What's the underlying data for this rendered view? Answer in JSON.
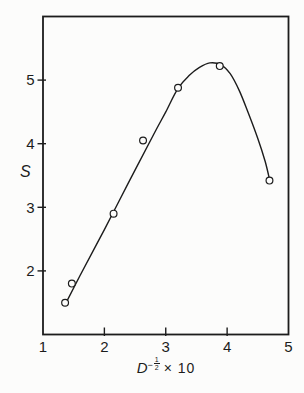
{
  "figure": {
    "background": "#fcfcfb",
    "ink": "#1c1c1c"
  },
  "y_axis_title": "S",
  "x_axis_title": {
    "variable": "D",
    "exponent_sign": "−",
    "exponent_numerator": "1",
    "exponent_denominator": "2",
    "multiplier": "× 10"
  },
  "chart_data": {
    "type": "scatter",
    "title": "",
    "xlabel": "D^(-1/2) × 10",
    "ylabel": "S",
    "xlim": [
      1,
      5
    ],
    "ylim": [
      1,
      6
    ],
    "grid": false,
    "legend": false,
    "marker": "open-circle",
    "x_tick_labels": [
      1,
      2,
      3,
      4,
      5
    ],
    "x_tick_marks": [
      2,
      3,
      4
    ],
    "y_tick_labels": [
      2,
      3,
      4,
      5
    ],
    "y_tick_marks": [
      2,
      3,
      4,
      5
    ],
    "points": [
      [
        1.36,
        1.5
      ],
      [
        1.47,
        1.8
      ],
      [
        2.15,
        2.9
      ],
      [
        2.63,
        4.05
      ],
      [
        3.2,
        4.88
      ],
      [
        3.88,
        5.22
      ],
      [
        4.69,
        3.42
      ]
    ],
    "fit_curve": [
      [
        1.36,
        1.47
      ],
      [
        1.6,
        1.92
      ],
      [
        2.0,
        2.65
      ],
      [
        2.4,
        3.4
      ],
      [
        2.8,
        4.14
      ],
      [
        3.0,
        4.5
      ],
      [
        3.2,
        4.87
      ],
      [
        3.38,
        5.07
      ],
      [
        3.55,
        5.2
      ],
      [
        3.72,
        5.27
      ],
      [
        3.9,
        5.24
      ],
      [
        4.05,
        5.1
      ],
      [
        4.2,
        4.83
      ],
      [
        4.35,
        4.47
      ],
      [
        4.5,
        4.08
      ],
      [
        4.62,
        3.72
      ],
      [
        4.69,
        3.44
      ]
    ]
  }
}
